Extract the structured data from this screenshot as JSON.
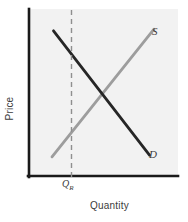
{
  "figure": {
    "background_color": "#ffffff",
    "plot_background_color": "#f2f2f2"
  },
  "axes": {
    "x_label": "Quantity",
    "y_label": "Price",
    "axis_color": "#1a1a1a"
  },
  "labels": {
    "supply": "S",
    "demand": "D",
    "quota_q": "Q",
    "quota_sub": "R"
  },
  "colors": {
    "supply_line": "#9d9d9d",
    "demand_line": "#262626",
    "dashed_line": "#8f8f8f",
    "text": "#3b3b3b"
  },
  "chart_data": {
    "type": "line",
    "title": "",
    "xlabel": "Quantity",
    "ylabel": "Price",
    "xlim": [
      0,
      100
    ],
    "ylim": [
      0,
      100
    ],
    "grid": false,
    "legend": "inline-curve-labels",
    "series": [
      {
        "name": "S",
        "label": "S",
        "color": "#9d9d9d",
        "style": "solid",
        "x": [
          16,
          84
        ],
        "y": [
          12,
          88
        ]
      },
      {
        "name": "D",
        "label": "D",
        "color": "#262626",
        "style": "solid",
        "x": [
          17,
          81
        ],
        "y": [
          87,
          13
        ]
      },
      {
        "name": "Q_R",
        "label": "Q_R",
        "color": "#8f8f8f",
        "style": "dashed",
        "x": [
          29,
          29
        ],
        "y": [
          0,
          100
        ]
      }
    ],
    "annotations": [
      {
        "text": "Q_R",
        "x": 29,
        "y": -7
      },
      {
        "text": "S",
        "x": 88,
        "y": 91
      },
      {
        "text": "D",
        "x": 86,
        "y": 11
      }
    ],
    "equilibrium": {
      "x": 48,
      "y": 49
    }
  }
}
